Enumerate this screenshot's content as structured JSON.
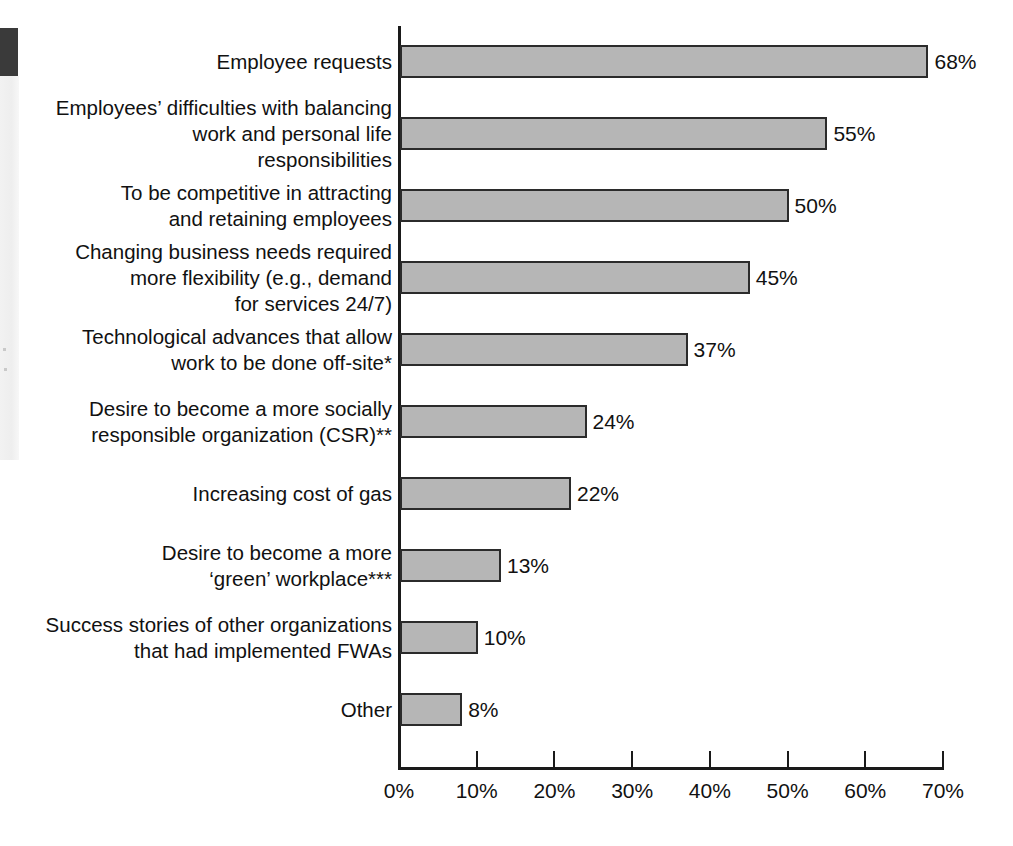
{
  "chart_data": {
    "type": "bar",
    "orientation": "horizontal",
    "title": "",
    "xlabel": "",
    "ylabel": "",
    "xlim": [
      0,
      70
    ],
    "xtick_labels": [
      "0%",
      "10%",
      "20%",
      "30%",
      "40%",
      "50%",
      "60%",
      "70%"
    ],
    "xticks": [
      0,
      10,
      20,
      30,
      40,
      50,
      60,
      70
    ],
    "grid": false,
    "legend": null,
    "categories": [
      "Employee requests",
      "Employees’ difficulties with balancing\nwork and personal life\nresponsibilities",
      "To be competitive in attracting\nand retaining employees",
      "Changing business needs required\nmore flexibility (e.g., demand\nfor services 24/7)",
      "Technological advances that allow\nwork to be done off-site*",
      "Desire to become a more socially\nresponsible organization (CSR)**",
      "Increasing cost of gas",
      "Desire to become a more\n‘green’ workplace***",
      "Success stories of other organizations\nthat had implemented FWAs",
      "Other"
    ],
    "values": [
      68,
      55,
      50,
      45,
      37,
      24,
      22,
      13,
      10,
      8
    ],
    "value_labels": [
      "68%",
      "55%",
      "50%",
      "45%",
      "37%",
      "24%",
      "22%",
      "13%",
      "10%",
      "8%"
    ],
    "bar_fill_color": "#b6b6b6",
    "bar_edge_color": "#2b2b2b",
    "axis_color": "#1a1a1a",
    "text_color": "#111111"
  }
}
